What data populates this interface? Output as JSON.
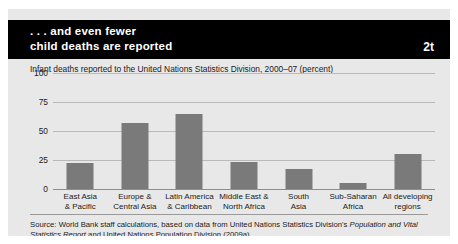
{
  "header": {
    "line1": ". . . and even fewer",
    "line2": "child deaths are reported",
    "figure_number": "2t",
    "background_color": "#000000",
    "text_color": "#ffffff"
  },
  "source": {
    "prefix": "Source: World Bank staff calculations, based on data from United Nations Statistics Division's ",
    "italic1": "Population and Vital Statistics Report",
    "middle": " and United Nations Population Division (2009a).",
    "full_text": "Source: World Bank staff calculations, based on data from United Nations Statistics Division's Population and Vital Statistics Report and United Nations Population Division (2009a)."
  },
  "colors": {
    "panel": "#e8e8e8",
    "bar": "#7a7a7a",
    "gridline": "#b9b9b9",
    "baseline": "#8e8e8e"
  },
  "chart_data": {
    "type": "bar",
    "title": "Infant deaths reported to the United Nations Statistics Division, 2000–07 (percent)",
    "xlabel": "",
    "ylabel": "",
    "ylim": [
      0,
      100
    ],
    "yticks": [
      0,
      25,
      50,
      75,
      100
    ],
    "ytick_labels": [
      "0",
      "25",
      "50",
      "75",
      "100"
    ],
    "grid": true,
    "legend": "none",
    "categories": [
      "East Asia\n& Pacific",
      "Europe &\nCentral Asia",
      "Latin America\n& Caribbean",
      "Middle East &\nNorth Africa",
      "South\nAsia",
      "Sub-Saharan\nAfrica",
      "All developing\nregions"
    ],
    "category_lines": [
      [
        "East Asia",
        "& Pacific"
      ],
      [
        "Europe &",
        "Central Asia"
      ],
      [
        "Latin America",
        "& Caribbean"
      ],
      [
        "Middle East &",
        "North Africa"
      ],
      [
        "South",
        "Asia"
      ],
      [
        "Sub-Saharan",
        "Africa"
      ],
      [
        "All developing",
        "regions"
      ]
    ],
    "values": [
      22,
      57,
      65,
      23,
      17,
      5,
      30
    ]
  }
}
